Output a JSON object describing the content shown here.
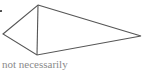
{
  "diagram": {
    "type": "quadrilateral-kite",
    "vertices": {
      "top": [
        38,
        5
      ],
      "left": [
        3,
        34
      ],
      "bottom": [
        37,
        55
      ],
      "right": [
        141,
        36
      ]
    },
    "diagonal": [
      "top",
      "bottom"
    ],
    "stroke_color": "#555555",
    "marker_dot": [
      1,
      11
    ]
  },
  "caption": "not necessarily"
}
